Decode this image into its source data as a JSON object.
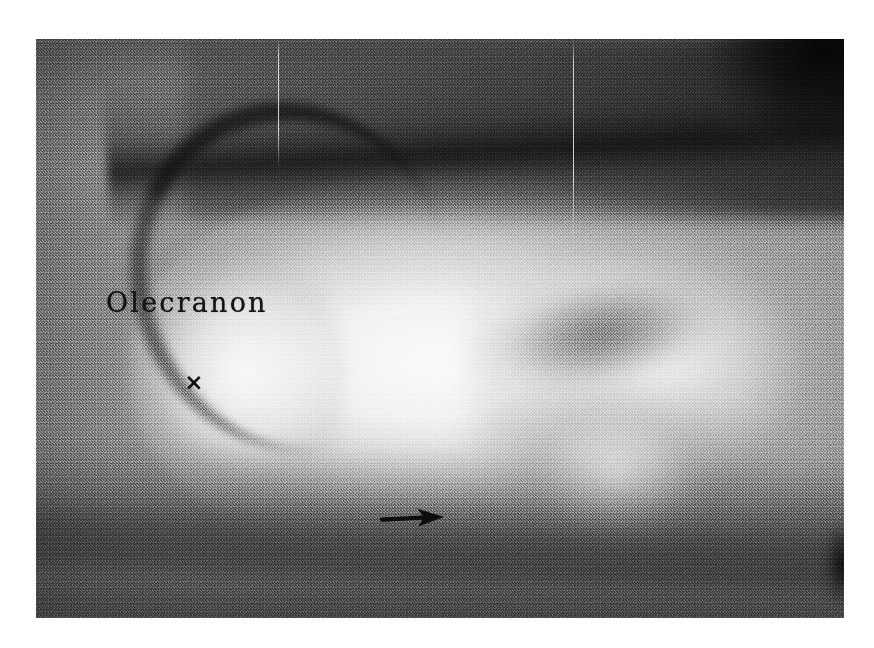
{
  "figure": {
    "kind": "radiograph",
    "modality": "X-ray",
    "anatomy": "elbow / proximal ulna",
    "view": "lateral",
    "plate": {
      "left": 36,
      "top": 39,
      "width": 808,
      "height": 579,
      "background_color": "#8e8e8e",
      "surround_color": "#ffffff"
    }
  },
  "annotations": {
    "label": {
      "text": "Olecranon",
      "color": "#131313",
      "x": 70,
      "y": 248
    },
    "cross_marker": {
      "glyph": "×",
      "color": "#101010",
      "x": 157,
      "y": 347
    },
    "arrow_marker": {
      "glyph": "→",
      "direction": "right",
      "color": "#0d0d0d",
      "x": 344,
      "y": 478,
      "length": 64
    }
  },
  "artifacts": {
    "scratches": [
      {
        "name": "scratch-1",
        "x": 278,
        "y_top": 39,
        "length": 130,
        "color": "#ffffff"
      },
      {
        "name": "scratch-2",
        "x": 573,
        "y_top": 39,
        "length": 200,
        "color": "#ffffff"
      }
    ]
  },
  "tones": {
    "bone_bright": "#f5f5f5",
    "soft_tissue": "#9a9a9a",
    "cortex_dark": "#101010",
    "corner_black": "#000000"
  }
}
